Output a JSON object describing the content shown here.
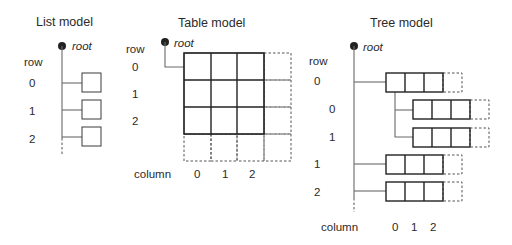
{
  "diagram": {
    "list_model": {
      "title": "List model",
      "root_label": "root",
      "axis_label": "row",
      "rows": [
        "0",
        "1",
        "2"
      ]
    },
    "table_model": {
      "title": "Table model",
      "root_label": "root",
      "row_axis_label": "row",
      "rows": [
        "0",
        "1",
        "2"
      ],
      "column_axis_label": "column",
      "columns": [
        "0",
        "1",
        "2"
      ]
    },
    "tree_model": {
      "title": "Tree model",
      "root_label": "root",
      "row_axis_label": "row",
      "top_rows": [
        "0",
        "1",
        "2"
      ],
      "child_rows_of_row_0": [
        "0",
        "1"
      ],
      "column_axis_label": "column",
      "columns": [
        "0",
        "1",
        "2"
      ]
    }
  }
}
